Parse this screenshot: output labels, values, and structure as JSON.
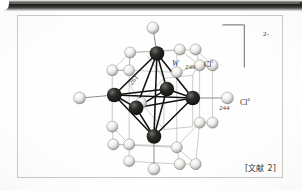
{
  "figure": {
    "caption_reference": "[文献 2]",
    "charge_label": "2-",
    "labels": {
      "metal": "W",
      "chlorine_inner": "Cl",
      "chlorine_inner_sup": "i",
      "chlorine_apical": "Cl",
      "chlorine_apical_sup": "a",
      "distance_wcl_inner": "249",
      "distance_ww": "261",
      "distance_wcl_apical": "244"
    },
    "colors": {
      "metal_atom": "#201f1d",
      "chlorine_atom": "#e4e4e2",
      "chlorine_atom_shade": "#9a9a96",
      "bond_strong": "#111110",
      "bond_thin": "#8a8a86",
      "frame_border": "#c9c9c6",
      "page_background": "#ffffff",
      "scan_bar": "#1d1d1c",
      "text": "#35352f"
    },
    "geometry": {
      "metal_atoms": [
        {
          "name": "W-top",
          "x": 157,
          "y": 53,
          "r": 7.4
        },
        {
          "name": "W-left",
          "x": 114,
          "y": 95,
          "r": 7.4
        },
        {
          "name": "W-right",
          "x": 193,
          "y": 98,
          "r": 7.4
        },
        {
          "name": "W-bottom",
          "x": 154,
          "y": 137,
          "r": 7.4
        },
        {
          "name": "W-front",
          "x": 136,
          "y": 108,
          "r": 7.4
        },
        {
          "name": "W-back",
          "x": 167,
          "y": 89,
          "r": 7.4
        }
      ],
      "axial_chlorines": [
        {
          "name": "Cl-axial-top",
          "x": 152,
          "y": 24,
          "r": 6.0
        },
        {
          "name": "Cl-axial-bottom",
          "x": 152,
          "y": 171,
          "r": 6.0
        },
        {
          "name": "Cl-axial-left",
          "x": 79,
          "y": 98,
          "r": 6.0
        },
        {
          "name": "Cl-axial-right",
          "x": 226,
          "y": 98,
          "r": 6.0
        }
      ],
      "bridging_chlorines": [
        {
          "name": "Cl-b1",
          "x": 130,
          "y": 52,
          "r": 5.6
        },
        {
          "name": "Cl-b2",
          "x": 180,
          "y": 49,
          "r": 5.6
        },
        {
          "name": "Cl-b3",
          "x": 112,
          "y": 70,
          "r": 5.6
        },
        {
          "name": "Cl-b4",
          "x": 196,
          "y": 65,
          "r": 5.6
        },
        {
          "name": "Cl-b5",
          "x": 177,
          "y": 72,
          "r": 5.6
        },
        {
          "name": "Cl-b6",
          "x": 200,
          "y": 78,
          "r": 5.6
        },
        {
          "name": "Cl-b7",
          "x": 124,
          "y": 122,
          "r": 5.6
        },
        {
          "name": "Cl-b8",
          "x": 112,
          "y": 127,
          "r": 5.6
        },
        {
          "name": "Cl-b9",
          "x": 188,
          "y": 123,
          "r": 5.6
        },
        {
          "name": "Cl-b10",
          "x": 175,
          "y": 143,
          "r": 5.6
        },
        {
          "name": "Cl-b11",
          "x": 113,
          "y": 145,
          "r": 5.6
        },
        {
          "name": "Cl-b12",
          "x": 139,
          "y": 80,
          "r": 5.6
        }
      ]
    }
  }
}
